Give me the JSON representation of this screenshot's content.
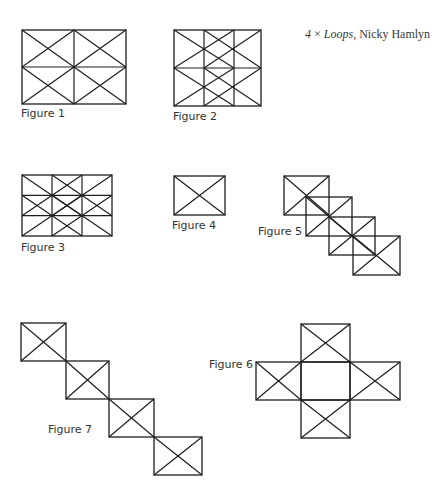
{
  "title": {
    "count": "4",
    "times": " × ",
    "work": "Loops",
    "separator": ", ",
    "author": "Nicky Hamlyn"
  },
  "colors": {
    "line": "#1e1e1e",
    "label": "#333333",
    "background": "#ffffff"
  },
  "figures": [
    {
      "id": 1,
      "label": "Figure 1",
      "label_pos": [
        21,
        108
      ],
      "description": "2x2 grid, X in each cell"
    },
    {
      "id": 2,
      "label": "Figure 2",
      "label_pos": [
        173,
        111
      ],
      "description": "overlapping offset X grids, 3 columns x 2 rows"
    },
    {
      "id": 3,
      "label": "Figure 3",
      "label_pos": [
        21,
        242
      ],
      "description": "3x3 grid with X across each 2x2 block"
    },
    {
      "id": 4,
      "label": "Figure 4",
      "label_pos": [
        172,
        220
      ],
      "description": "single rectangle with X"
    },
    {
      "id": 5,
      "label": "Figure 5",
      "label_pos": [
        258,
        226
      ],
      "description": "four overlapping rectangles stepping diagonally"
    },
    {
      "id": 6,
      "label": "Figure 6",
      "label_pos": [
        209,
        359
      ],
      "description": "cross of four X rectangles around an empty centre"
    },
    {
      "id": 7,
      "label": "Figure 7",
      "label_pos": [
        48,
        424
      ],
      "description": "four X rectangles touching corner to corner"
    }
  ],
  "geometry": {
    "fig1": {
      "x": 22,
      "y": 30,
      "w": 104,
      "h": 74,
      "cols": 2,
      "rows": 2
    },
    "fig2": {
      "x": 174,
      "y": 30,
      "w": 87,
      "h": 76,
      "verticals": [
        204,
        234
      ]
    },
    "fig3": {
      "x": 22,
      "y": 175,
      "w": 90,
      "h": 61,
      "cols": 3,
      "rows": 3
    },
    "fig4": {
      "x": 174,
      "y": 176,
      "w": 51,
      "h": 39
    },
    "fig5": {
      "rects": [
        [
          284,
          176,
          45,
          39
        ],
        [
          306,
          197,
          46,
          39
        ],
        [
          329,
          217,
          46,
          38
        ],
        [
          353,
          236,
          47,
          39
        ]
      ]
    },
    "fig6": {
      "rects": [
        [
          301,
          324,
          49,
          38
        ],
        [
          256,
          362,
          45,
          38
        ],
        [
          350,
          362,
          50,
          38
        ],
        [
          301,
          400,
          49,
          38
        ]
      ],
      "center": [
        301,
        362,
        49,
        38
      ]
    },
    "fig7": {
      "rects": [
        [
          21,
          323,
          45,
          38
        ],
        [
          66,
          361,
          43,
          38
        ],
        [
          109,
          399,
          45,
          38
        ],
        [
          154,
          437,
          48,
          38
        ]
      ]
    }
  }
}
